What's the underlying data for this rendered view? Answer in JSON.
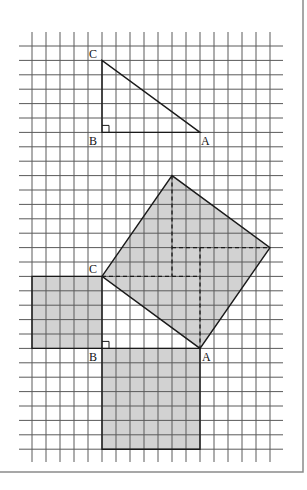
{
  "figure": {
    "colors": {
      "grid": "#5a5a5a",
      "edge": "#1a1a1a",
      "shade": "#d2d2d2",
      "frame": "#8a8a8a",
      "background": "#ffffff"
    },
    "grid": {
      "columns_lines": 18,
      "row_lines": 29,
      "x0": 32,
      "dx": 14,
      "y0": 46,
      "dy": 14.4,
      "vline_top": 32,
      "vline_bottom": 462,
      "hline_left": 19,
      "hline_right": 283
    },
    "top_triangle": {
      "vertices": {
        "A": [
          12,
          6
        ],
        "B": [
          5,
          6
        ],
        "C": [
          5,
          1
        ]
      },
      "labels": {
        "A": "A",
        "B": "B",
        "C": "C"
      },
      "right_angle_at": "B",
      "legs": {
        "BC": 5,
        "BA": 7
      }
    },
    "construction": {
      "vertices": {
        "A": [
          12,
          21
        ],
        "B": [
          5,
          21
        ],
        "C": [
          5,
          16
        ]
      },
      "labels": {
        "A": "A",
        "B": "B",
        "C": "C"
      },
      "right_angle_at": "B",
      "square_on_BC": {
        "corners": [
          [
            0,
            16
          ],
          [
            5,
            16
          ],
          [
            5,
            21
          ],
          [
            0,
            21
          ]
        ],
        "area_cells": 25
      },
      "square_on_BA": {
        "corners": [
          [
            5,
            21
          ],
          [
            12,
            21
          ],
          [
            12,
            28
          ],
          [
            5,
            28
          ]
        ],
        "area_cells": 49
      },
      "square_on_CA": {
        "corners": [
          [
            5,
            16
          ],
          [
            10,
            9
          ],
          [
            17,
            14
          ],
          [
            12,
            21
          ]
        ],
        "area_cells": 74
      },
      "dashed_segments": [
        [
          [
            10,
            9
          ],
          [
            10,
            16
          ]
        ],
        [
          [
            10,
            14
          ],
          [
            17,
            14
          ]
        ],
        [
          [
            12,
            14
          ],
          [
            12,
            21
          ]
        ],
        [
          [
            5,
            16
          ],
          [
            12,
            16
          ]
        ]
      ]
    }
  }
}
